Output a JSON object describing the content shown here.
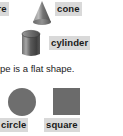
{
  "worksheet": {
    "background_color": "#ffffff",
    "text_color": "#1b1b1b",
    "highlight_color": "#d9d9d9",
    "shape_fill_color": "#6e6e6e",
    "sentence": "pe is a flat shape.",
    "labels": {
      "sphere": "ere",
      "cone": "cone",
      "cylinder": "cylinder",
      "circle": "circle",
      "square": "square",
      "edge_sliver": ""
    },
    "shapes": [
      {
        "name": "cone",
        "kind": "3d",
        "label": "cone"
      },
      {
        "name": "cylinder",
        "kind": "3d",
        "label": "cylinder"
      },
      {
        "name": "circle",
        "kind": "2d",
        "label": "circle"
      },
      {
        "name": "square",
        "kind": "2d",
        "label": "square"
      }
    ]
  }
}
